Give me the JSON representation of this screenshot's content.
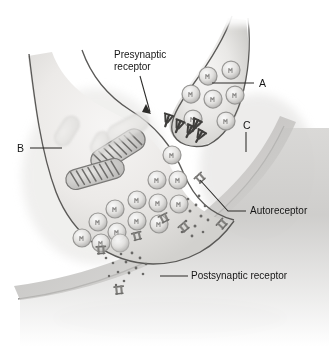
{
  "figure": {
    "name": "synapse-diagram",
    "type": "anatomical-illustration",
    "style": "grayscale-pencil-shaded",
    "background_color": "#ffffff",
    "ink_color": "#4a4a4a",
    "text_color": "#161616",
    "membrane_color": "#5a5a5a",
    "cytoplasm_color": "#ecebe9",
    "cleft_color": "#c9c8c6",
    "receptor_color": "#8e8d8b",
    "presynaptic_receptor_color": "#4f4e4c"
  },
  "labels": [
    {
      "id": "presynaptic-receptor",
      "text": "Presynaptic\nreceptor",
      "x": 114,
      "y": 50,
      "align": "left",
      "leader": "line-with-arrowhead"
    },
    {
      "id": "autoreceptor",
      "text": "Autoreceptor",
      "x": 250,
      "y": 205,
      "align": "left",
      "leader": "bent-line"
    },
    {
      "id": "postsynaptic-receptor",
      "text": "Postsynaptic receptor",
      "x": 191,
      "y": 270,
      "align": "left",
      "leader": "straight-line"
    }
  ],
  "letter_labels": [
    {
      "id": "label-a",
      "text": "A",
      "x": 259,
      "y": 78,
      "leader": "horizontal-line-left"
    },
    {
      "id": "label-b",
      "text": "B",
      "x": 17,
      "y": 142,
      "leader": "horizontal-line-right"
    },
    {
      "id": "label-c",
      "text": "C",
      "x": 243,
      "y": 120,
      "leader": "vertical-line-down"
    }
  ],
  "structures": {
    "axon_terminal": "presynaptic-axon-terminal-bouton",
    "cell_body": "presynaptic-neuron-cell-body",
    "synaptic_cleft": "synaptic-cleft",
    "postsynaptic_membrane": "postsynaptic-neuron-membrane",
    "vesicle_count_terminal": 7,
    "vesicle_count_body": 14,
    "mitochondria_count": 2,
    "faded_organelle_count": 3,
    "presynaptic_receptor_count": 5,
    "autoreceptor_count": 5,
    "postsynaptic_receptor_count": 2,
    "neurotransmitter_dot_clusters": 3
  }
}
